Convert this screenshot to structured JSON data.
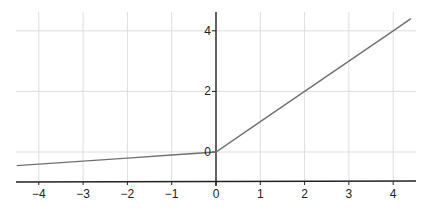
{
  "chart_data": {
    "type": "line",
    "title": "",
    "xlabel": "",
    "ylabel": "",
    "xlim": [
      -4.5,
      4.5
    ],
    "ylim": [
      -1,
      4.5
    ],
    "grid": true,
    "legend": null,
    "x_ticks": [
      -4,
      -3,
      -2,
      -1,
      0,
      1,
      2,
      3,
      4
    ],
    "x_tick_labels": [
      "−4",
      "−3",
      "−2",
      "−1",
      "0",
      "1",
      "2",
      "3",
      "4"
    ],
    "y_ticks": [
      0,
      2,
      4
    ],
    "y_tick_labels": [
      "0",
      "2",
      "4"
    ],
    "series": [
      {
        "name": "Leaky ReLU",
        "function": "f(x) = x for x >= 0, 0.1x for x < 0",
        "color": "#707070",
        "x": [
          -4.5,
          -4,
          -3,
          -2,
          -1,
          0,
          1,
          2,
          3,
          4,
          4.4
        ],
        "y": [
          -0.45,
          -0.4,
          -0.3,
          -0.2,
          -0.1,
          0,
          1,
          2,
          3,
          4,
          4.4
        ]
      }
    ]
  },
  "colors": {
    "axis": "#222222",
    "grid": "#dddddd",
    "line": "#707070",
    "background": "#ffffff"
  }
}
